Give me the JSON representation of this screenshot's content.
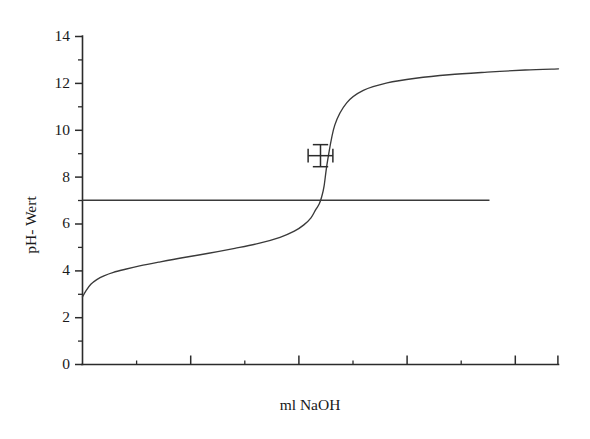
{
  "chart_data": {
    "type": "line",
    "title": "",
    "subtitle": "",
    "xlabel": "ml NaOH",
    "ylabel": "pH- Wert",
    "xlim": [
      0,
      20
    ],
    "ylim": [
      0,
      14
    ],
    "grid": false,
    "legend": "none",
    "y_ticks_major": [
      0,
      2,
      4,
      6,
      8,
      10,
      12,
      14
    ],
    "y_ticks_minor": [
      1,
      3,
      5,
      7,
      9,
      11,
      13
    ],
    "y_tick_labels": [
      "0",
      "2",
      "4",
      "6",
      "8",
      "10",
      "12",
      "14"
    ],
    "x_ticks_major": [
      2,
      4,
      6,
      8,
      10,
      12,
      14,
      16,
      18,
      20
    ],
    "x_ticks_minor": [
      1,
      3,
      5,
      7,
      9,
      11,
      13,
      15,
      17,
      19
    ],
    "x_tick_labels": [],
    "series": [
      {
        "name": "Titrationskurve",
        "type": "line",
        "color": "#3a3a3a",
        "x": [
          0.0,
          0.15,
          0.35,
          0.6,
          0.9,
          1.3,
          1.8,
          2.4,
          3.2,
          4.2,
          5.3,
          6.4,
          7.4,
          8.3,
          8.9,
          9.3,
          9.6,
          9.8,
          9.95,
          10.05,
          10.15,
          10.3,
          10.6,
          11.1,
          11.8,
          12.8,
          14.0,
          15.4,
          17.0,
          18.6,
          20.0
        ],
        "y": [
          2.88,
          3.15,
          3.42,
          3.62,
          3.78,
          3.93,
          4.06,
          4.2,
          4.36,
          4.55,
          4.74,
          4.95,
          5.16,
          5.42,
          5.68,
          5.95,
          6.25,
          6.6,
          6.85,
          7.15,
          7.6,
          8.7,
          10.2,
          11.15,
          11.68,
          12.0,
          12.2,
          12.35,
          12.46,
          12.55,
          12.6
        ]
      },
      {
        "name": "Neutralpunkt-Linie",
        "type": "hline",
        "color": "#3a3a3a",
        "y_value": 7.0,
        "x_start": 0.0,
        "x_end": 17.1
      }
    ],
    "annotations": [
      {
        "name": "error-bar-marker",
        "type": "errorbar-cross",
        "x": 10.0,
        "y": 8.9,
        "x_error": 0.52,
        "y_error": 0.47,
        "color": "#2b2b2b"
      }
    ]
  },
  "labels": {
    "y_axis_title": "pH- Wert",
    "x_axis_title": "ml NaOH"
  }
}
